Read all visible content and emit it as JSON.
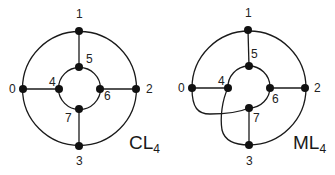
{
  "diagrams": [
    {
      "name": "CL",
      "subscript": "4",
      "nodes": [
        {
          "id": "0",
          "x": 23,
          "y": 89,
          "label": "0"
        },
        {
          "id": "1",
          "x": 79,
          "y": 31,
          "label": "1"
        },
        {
          "id": "2",
          "x": 136,
          "y": 89,
          "label": "2"
        },
        {
          "id": "3",
          "x": 79,
          "y": 146,
          "label": "3"
        },
        {
          "id": "4",
          "x": 59,
          "y": 89,
          "label": "4"
        },
        {
          "id": "5",
          "x": 79,
          "y": 67,
          "label": "5"
        },
        {
          "id": "6",
          "x": 100,
          "y": 89,
          "label": "6"
        },
        {
          "id": "7",
          "x": 79,
          "y": 109,
          "label": "7"
        }
      ],
      "edges": [
        [
          "0",
          "1"
        ],
        [
          "1",
          "2"
        ],
        [
          "2",
          "3"
        ],
        [
          "3",
          "0"
        ],
        [
          "4",
          "5"
        ],
        [
          "5",
          "6"
        ],
        [
          "6",
          "7"
        ],
        [
          "7",
          "4"
        ],
        [
          "0",
          "4"
        ],
        [
          "1",
          "5"
        ],
        [
          "2",
          "6"
        ],
        [
          "3",
          "7"
        ]
      ]
    },
    {
      "name": "ML",
      "subscript": "4",
      "nodes": [
        {
          "id": "0",
          "x": 192,
          "y": 88,
          "label": "0"
        },
        {
          "id": "1",
          "x": 248,
          "y": 30,
          "label": "1"
        },
        {
          "id": "2",
          "x": 305,
          "y": 88,
          "label": "2"
        },
        {
          "id": "3",
          "x": 249,
          "y": 145,
          "label": "3"
        },
        {
          "id": "4",
          "x": 228,
          "y": 88,
          "label": "4"
        },
        {
          "id": "5",
          "x": 249,
          "y": 66,
          "label": "5"
        },
        {
          "id": "6",
          "x": 270,
          "y": 88,
          "label": "6"
        },
        {
          "id": "7",
          "x": 249,
          "y": 108,
          "label": "7"
        }
      ],
      "edges": [
        [
          "0",
          "1"
        ],
        [
          "1",
          "2"
        ],
        [
          "2",
          "3"
        ],
        [
          "0",
          "7"
        ],
        [
          "4",
          "5"
        ],
        [
          "5",
          "6"
        ],
        [
          "6",
          "7"
        ],
        [
          "4",
          "3"
        ],
        [
          "0",
          "4"
        ],
        [
          "1",
          "5"
        ],
        [
          "2",
          "6"
        ],
        [
          "3",
          "7"
        ]
      ]
    }
  ]
}
